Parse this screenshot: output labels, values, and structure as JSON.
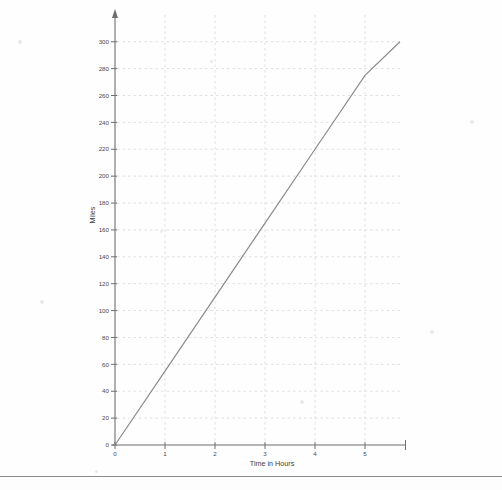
{
  "chart_data": {
    "type": "line",
    "title": "",
    "subtitle": "",
    "xlabel": "Time in Hours",
    "ylabel": "Miles",
    "xlim": [
      0,
      5.7
    ],
    "ylim": [
      0,
      305
    ],
    "grid": true,
    "legend": null,
    "legend_position": "none",
    "x_ticks": [
      0,
      1,
      2,
      3,
      4,
      5
    ],
    "x_tick_labels": [
      "0",
      "1",
      "2",
      "3",
      "4",
      "5"
    ],
    "y_ticks": [
      0,
      20,
      40,
      60,
      80,
      100,
      120,
      140,
      160,
      180,
      200,
      220,
      240,
      260,
      280,
      300
    ],
    "y_tick_labels": [
      "0",
      "20",
      "40",
      "60",
      "80",
      "100",
      "120",
      "140",
      "160",
      "180",
      "200",
      "220",
      "240",
      "260",
      "280",
      "300"
    ],
    "series": [
      {
        "name": "distance",
        "color": "#8b8b90",
        "x": [
          0,
          1,
          2,
          3,
          4,
          5,
          5.7
        ],
        "values": [
          0,
          55,
          110,
          165,
          220,
          275,
          300
        ]
      }
    ],
    "annotations": []
  },
  "axes": {
    "x_axis_name": "x-axis",
    "y_axis_name": "y-axis",
    "y_axis_has_arrow": true
  },
  "page": {
    "background_color": "#fefefe",
    "rule_color": "#8a8a8e"
  }
}
